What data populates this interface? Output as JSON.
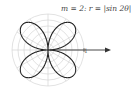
{
  "chart_data": {
    "type": "line",
    "subtype": "polar",
    "title": "m = 2:  r = |sin 2θ|",
    "function": "r = |sin 2θ|",
    "m": 2,
    "petals": 4,
    "r_max": 1,
    "tick_labels": [
      "1"
    ],
    "grid": true,
    "grid_circles": 6,
    "grid_radial_lines": 12,
    "axis": "positive x-axis arrow",
    "legend": null
  },
  "labels": {
    "title": "m = 2:  r = |sin 2θ|",
    "tick_one": "1"
  },
  "colors": {
    "curve": "#222222",
    "grid": "#cccccc",
    "axis": "#333333"
  }
}
